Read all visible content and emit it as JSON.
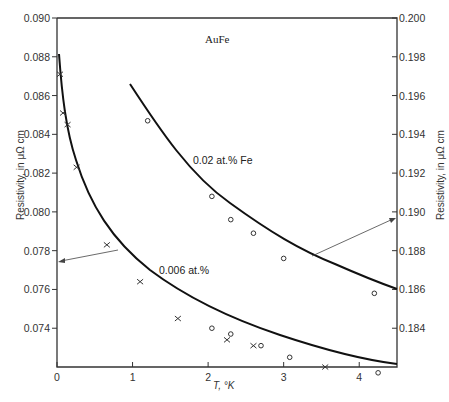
{
  "chart_data": {
    "type": "scatter",
    "title": "AuFe",
    "xlabel": "T, °K",
    "ylabel_left": "Resistivity, in μΩ cm",
    "ylabel_right": "Resistivity, in μΩ cm",
    "xlim": [
      0,
      4.5
    ],
    "ylim_left": [
      0.072,
      0.09
    ],
    "ylim_right": [
      0.182,
      0.2
    ],
    "x_ticks": [
      "0",
      "1",
      "2",
      "3",
      "4"
    ],
    "y_ticks_left": [
      "0.090",
      "0.088",
      "0.086",
      "0.084",
      "0.082",
      "0.080",
      "0.078",
      "0.076",
      "0.074"
    ],
    "y_ticks_right": [
      "0.200",
      "0.198",
      "0.196",
      "0.194",
      "0.192",
      "0.190",
      "0.188",
      "0.186",
      "0.184"
    ],
    "grid": false,
    "series": [
      {
        "name": "0.006 at.% (×)",
        "axis": "left",
        "marker": "x",
        "x": [
          0.04,
          0.08,
          0.14,
          0.26,
          0.66,
          1.1,
          1.6,
          2.25,
          2.6,
          3.55
        ],
        "y": [
          0.0871,
          0.0851,
          0.0845,
          0.0823,
          0.0783,
          0.0764,
          0.0745,
          0.0734,
          0.0731,
          0.072
        ]
      },
      {
        "name": "0.006 at.% (○)",
        "axis": "left",
        "marker": "o",
        "x": [
          2.05,
          2.3,
          2.7,
          3.08,
          4.25
        ],
        "y": [
          0.074,
          0.0737,
          0.0731,
          0.0725,
          0.0717
        ]
      },
      {
        "name": "0.02 at.% Fe (○)",
        "axis": "right",
        "marker": "o",
        "x": [
          1.2,
          2.05,
          2.3,
          2.6,
          3.0,
          4.2
        ],
        "y": [
          0.1947,
          0.1908,
          0.1896,
          0.1889,
          0.1876,
          0.1858
        ]
      }
    ],
    "fit_curves": [
      {
        "name": "0.006 at.% fit",
        "axis": "left",
        "x_range": [
          0.03,
          4.5
        ]
      },
      {
        "name": "0.02 at.% Fe fit",
        "axis": "right",
        "x_range": [
          1.0,
          4.5
        ]
      }
    ],
    "annotations": [
      {
        "text": "AuFe",
        "x": 2.0,
        "y_right": 0.1985
      },
      {
        "text": "0.02 at.% Fe",
        "x": 1.6,
        "y_right": 0.1925,
        "arrow_to": "right axis"
      },
      {
        "text": "0.006 at.%",
        "x": 1.2,
        "y_left": 0.0763,
        "arrow_to": "left axis"
      }
    ]
  },
  "labels": {
    "title": "AuFe",
    "series_high": "0.02 at.% Fe",
    "series_low": "0.006 at.%",
    "xlabel": "T, °K",
    "ylabel": "Resistivity, in μΩ cm"
  }
}
